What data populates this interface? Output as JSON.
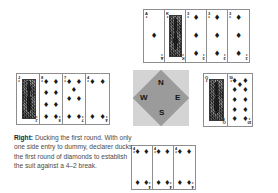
{
  "figure": {
    "suit_symbol": "♦",
    "suit_name": "diamonds",
    "type": "bridge-hand-diagram"
  },
  "compass": {
    "north": "N",
    "west": "W",
    "east": "E",
    "south": "S"
  },
  "caption": {
    "lead": "Right:",
    "body": " Ducking the first round. With only one side entry to dummy, declarer ducks the first round of diamonds to establish the suit against a 4–2 break."
  },
  "hands": {
    "north": {
      "label": "North hand",
      "cards": [
        {
          "rank": "A",
          "suit": "♦",
          "pips": 1,
          "face": false
        },
        {
          "rank": "K",
          "suit": "♦",
          "pips": 0,
          "face": true
        },
        {
          "rank": "3",
          "suit": "♦",
          "pips": 3,
          "face": false
        },
        {
          "rank": "3",
          "suit": "♦",
          "pips": 3,
          "face": false
        },
        {
          "rank": "3",
          "suit": "♦",
          "pips": 3,
          "face": false
        }
      ]
    },
    "west": {
      "label": "West hand",
      "cards": [
        {
          "rank": "J",
          "suit": "♦",
          "pips": 0,
          "face": true
        },
        {
          "rank": "8",
          "suit": "♦",
          "pips": 8,
          "face": false
        },
        {
          "rank": "7",
          "suit": "♦",
          "pips": 7,
          "face": false
        },
        {
          "rank": "4",
          "suit": "♦",
          "pips": 4,
          "face": false
        }
      ]
    },
    "east": {
      "label": "East hand",
      "cards": [
        {
          "rank": "Q",
          "suit": "♦",
          "pips": 0,
          "face": true
        },
        {
          "rank": "10",
          "suit": "♦",
          "pips": 10,
          "face": false
        }
      ]
    },
    "south": {
      "label": "South hand",
      "cards": [
        {
          "rank": "4",
          "suit": "♦",
          "pips": 4,
          "face": false
        },
        {
          "rank": "4",
          "suit": "♦",
          "pips": 4,
          "face": false
        },
        {
          "rank": "4",
          "suit": "♦",
          "pips": 4,
          "face": false
        }
      ]
    }
  },
  "colors": {
    "card_border": "#8e8e8e",
    "pip": "#1a1a1a",
    "compass_diamond": "#9b9b9b",
    "compass_bg": "#d4d4d4",
    "caption_text": "#4a4a4a",
    "caption_lead": "#1f1f1f"
  }
}
